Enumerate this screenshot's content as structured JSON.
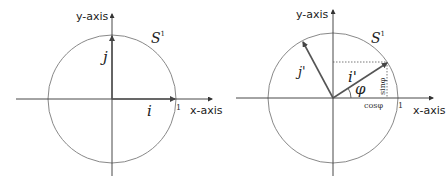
{
  "left_diagram": {
    "y_axis_label": "y-axis",
    "x_axis_label": "x-axis",
    "circle_label": "S",
    "circle_superscript": "1",
    "vector_i_label": "i",
    "vector_j_label": "j",
    "unit_tick_label": "1"
  },
  "right_diagram": {
    "y_axis_label": "y-axis",
    "x_axis_label": "x-axis",
    "circle_label": "S",
    "circle_superscript": "1",
    "vector_i_label": "i'",
    "vector_j_label": "j'",
    "angle_label": "φ",
    "cos_label": "cosφ",
    "sin_label": "sinφ",
    "unit_tick_label": "1"
  },
  "colors": {
    "axis": "#333333",
    "circle": "#777777",
    "vector": "#555555",
    "dotted": "#555555"
  }
}
